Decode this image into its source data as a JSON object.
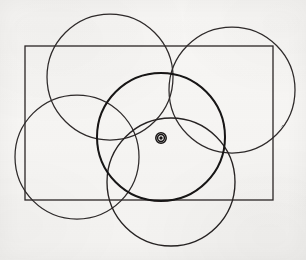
{
  "figure": {
    "title": "Overlapping circles and rectangle construction",
    "medium": "pencil-on-paper scan",
    "canvas": {
      "width": 306,
      "height": 260
    },
    "colors": {
      "paper": "#f7f6f4",
      "ink": "#221f1f",
      "ink_light": "#3a3636",
      "ink_bold": "#141212"
    },
    "shapes": {
      "rectangle": {
        "label": "rectangle",
        "x": 25,
        "y": 46,
        "width": 248,
        "height": 154,
        "stroke_width": 1.3,
        "stroke": "#2b2727"
      },
      "circles": [
        {
          "label": "top-left-circle",
          "cx": 110,
          "cy": 77,
          "r": 63,
          "stroke_width": 1.25,
          "stroke": "#2e2a2a"
        },
        {
          "label": "top-right-circle",
          "cx": 232,
          "cy": 90,
          "r": 63,
          "stroke_width": 1.25,
          "stroke": "#2e2a2a"
        },
        {
          "label": "left-circle",
          "cx": 77,
          "cy": 157,
          "r": 62,
          "stroke_width": 1.25,
          "stroke": "#2e2a2a"
        },
        {
          "label": "center-circle",
          "cx": 161,
          "cy": 137,
          "r": 64,
          "stroke_width": 2.0,
          "stroke": "#161313"
        },
        {
          "label": "bottom-circle",
          "cx": 171,
          "cy": 182,
          "r": 64,
          "stroke_width": 1.35,
          "stroke": "#262222"
        }
      ],
      "marker": {
        "label": "center-point-marker",
        "cx": 161,
        "cy": 138,
        "outer_r": 5.2,
        "ring_r": 3.4,
        "dot_r": 1.7,
        "stroke": "#161313",
        "fill": "#161313"
      }
    }
  }
}
